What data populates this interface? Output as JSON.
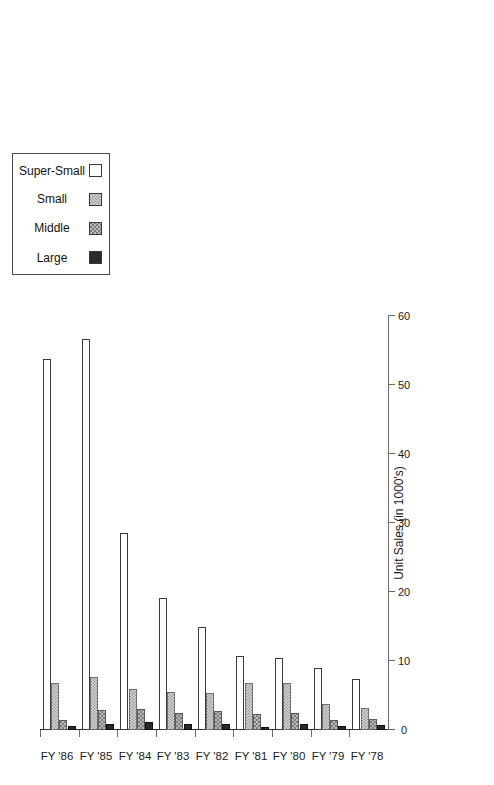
{
  "chart_data": {
    "type": "bar",
    "orientation": "horizontal-rotated",
    "title": "",
    "xlabel": "Unit Sales (in 1000's)",
    "ylabel": "",
    "categories": [
      "FY '78",
      "FY '79",
      "FY '80",
      "FY '81",
      "FY '82",
      "FY '83",
      "FY '84",
      "FY '85",
      "FY '86"
    ],
    "series": [
      {
        "name": "Large",
        "values": [
          0.7,
          0.6,
          0.8,
          0.5,
          0.9,
          0.9,
          1.1,
          0.9,
          0.6
        ]
      },
      {
        "name": "Middle",
        "values": [
          1.6,
          1.4,
          2.4,
          2.3,
          2.7,
          2.5,
          3.0,
          2.9,
          1.5
        ]
      },
      {
        "name": "Small",
        "values": [
          3.2,
          3.8,
          6.8,
          6.8,
          5.4,
          5.5,
          6.0,
          7.7,
          6.8
        ]
      },
      {
        "name": "Super-Small",
        "values": [
          7.4,
          9.0,
          10.4,
          10.7,
          14.9,
          19.1,
          28.6,
          56.7,
          53.8
        ]
      }
    ],
    "xlim": [
      0,
      60
    ],
    "xticks": [
      0,
      10,
      20,
      30,
      40,
      50,
      60
    ],
    "xtick_labels": [
      "0",
      "10",
      "20",
      "30",
      "40",
      "50",
      "60"
    ],
    "grid": false,
    "legend_position": "top-right",
    "colors": {
      "large": "#2a2a2a",
      "middle": "#9a9a9a",
      "small": "#c4c4c4",
      "super_small": "#ffffff",
      "axis": "#6b6b6b",
      "text": "#1a1a1a"
    }
  },
  "legend": {
    "items": [
      {
        "label": "Large",
        "swatch": "solid-black-swatch"
      },
      {
        "label": "Middle",
        "swatch": "medium-checker-swatch"
      },
      {
        "label": "Small",
        "swatch": "light-checker-swatch"
      },
      {
        "label": "Super-Small",
        "swatch": "white-swatch"
      }
    ]
  }
}
